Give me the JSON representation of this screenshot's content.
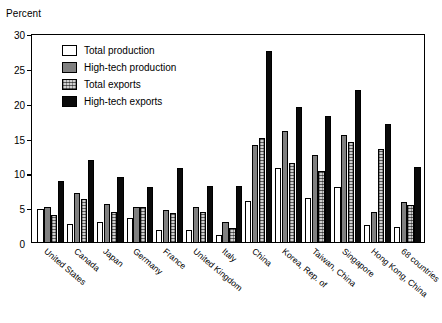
{
  "chart_data": {
    "type": "bar",
    "title": "",
    "subtitle": "",
    "xlabel": "",
    "ylabel": "Percent",
    "ylim": [
      0,
      30
    ],
    "yticks": [
      0,
      5,
      10,
      15,
      20,
      25,
      30
    ],
    "grid": false,
    "legend_position": "top-left inside plot",
    "orientation": "vertical-grouped",
    "categories": [
      "United States",
      "Canada",
      "Japan",
      "Germany",
      "France",
      "United Kingdom",
      "Italy",
      "China",
      "Korea, Rep. of",
      "Taiwan, China",
      "Singapore",
      "Hong Kong, China",
      "68 countries"
    ],
    "series": [
      {
        "name": "Total production",
        "fill": "white-outlined",
        "color": "#ffffff",
        "values": [
          4.9,
          2.8,
          3.0,
          3.6,
          1.9,
          1.8,
          1.2,
          6.0,
          10.7,
          6.4,
          8.1,
          2.6,
          2.3
        ]
      },
      {
        "name": "High-tech production",
        "fill": "solid-gray",
        "color": "#808080",
        "values": [
          5.1,
          7.2,
          5.6,
          5.2,
          4.8,
          5.1,
          3.0,
          14.0,
          16.1,
          12.7,
          15.5,
          4.5,
          5.9
        ]
      },
      {
        "name": "Total exports",
        "fill": "speckled-light-gray",
        "color": "#d0d0d0",
        "values": [
          4.0,
          6.3,
          4.4,
          5.1,
          4.3,
          4.4,
          2.2,
          15.1,
          11.5,
          10.4,
          14.5,
          13.5,
          5.5
        ]
      },
      {
        "name": "High-tech exports",
        "fill": "solid-black",
        "color": "#0a0a0a",
        "values": [
          8.9,
          11.9,
          9.5,
          8.1,
          10.7,
          8.2,
          8.2,
          27.5,
          19.5,
          18.3,
          22.0,
          17.1,
          10.9
        ]
      }
    ]
  }
}
